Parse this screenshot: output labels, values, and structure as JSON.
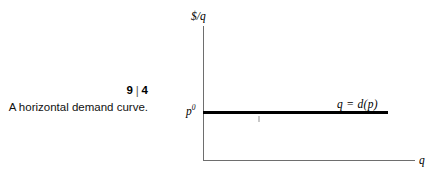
{
  "figure": {
    "number": "9",
    "number_separator": "|",
    "number_secondary": "4",
    "caption": "A horizontal demand curve."
  },
  "chart_data": {
    "type": "line",
    "title": "A horizontal demand curve.",
    "xlabel": "q",
    "ylabel": "$/q",
    "series": [
      {
        "name": "q = d(p)",
        "label": "q = d(p)",
        "orientation": "horizontal",
        "y_value_label": "p",
        "y_value_superscript": "0",
        "points": [
          [
            0,
            "p0"
          ],
          [
            "qmax",
            "p0"
          ]
        ]
      }
    ],
    "axis_labels": {
      "y_axis_top": "$/q",
      "y_axis_tick": "p",
      "y_axis_tick_superscript": "0",
      "x_axis_end": "q"
    },
    "grid": false,
    "legend": "none",
    "annotations": [
      "q = d(p)"
    ]
  },
  "colors": {
    "background": "#ffffff",
    "axis": "#6e6e6e",
    "curve": "#000000",
    "text": "#000000"
  }
}
